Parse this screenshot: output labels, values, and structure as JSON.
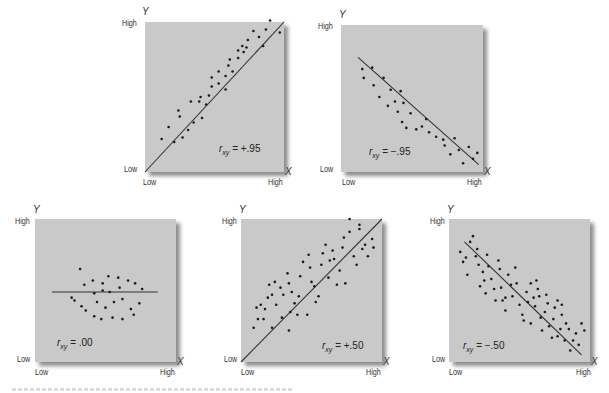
{
  "figure": {
    "axis_labels": {
      "x_axis": "X",
      "y_axis": "Y",
      "low": "Low",
      "high": "High"
    },
    "colors": {
      "plot_bg": "#c9c9c9",
      "dot": "#1a1a1a",
      "line": "#333333",
      "page_bg": "#ffffff"
    }
  },
  "chart_data": [
    {
      "type": "scatter",
      "title": "r_xy = +.95",
      "r_label": "= +.95",
      "xlabel": "X",
      "ylabel": "Y",
      "x_ticks": [
        "Low",
        "High"
      ],
      "y_ticks": [
        "Low",
        "High"
      ],
      "xlim": [
        0,
        1
      ],
      "ylim": [
        0,
        1
      ],
      "fit_line": [
        [
          0,
          0
        ],
        [
          1,
          1
        ]
      ],
      "points": [
        [
          0.12,
          0.22
        ],
        [
          0.17,
          0.3
        ],
        [
          0.21,
          0.2
        ],
        [
          0.24,
          0.41
        ],
        [
          0.25,
          0.37
        ],
        [
          0.27,
          0.23
        ],
        [
          0.31,
          0.28
        ],
        [
          0.33,
          0.47
        ],
        [
          0.35,
          0.33
        ],
        [
          0.39,
          0.47
        ],
        [
          0.4,
          0.5
        ],
        [
          0.41,
          0.36
        ],
        [
          0.44,
          0.45
        ],
        [
          0.46,
          0.51
        ],
        [
          0.48,
          0.57
        ],
        [
          0.48,
          0.63
        ],
        [
          0.53,
          0.67
        ],
        [
          0.53,
          0.59
        ],
        [
          0.58,
          0.64
        ],
        [
          0.58,
          0.55
        ],
        [
          0.6,
          0.71
        ],
        [
          0.61,
          0.75
        ],
        [
          0.63,
          0.67
        ],
        [
          0.67,
          0.76
        ],
        [
          0.67,
          0.81
        ],
        [
          0.7,
          0.84
        ],
        [
          0.71,
          0.8
        ],
        [
          0.73,
          0.83
        ],
        [
          0.74,
          0.88
        ],
        [
          0.78,
          0.94
        ],
        [
          0.82,
          0.9
        ],
        [
          0.85,
          0.84
        ],
        [
          0.87,
          0.95
        ],
        [
          0.9,
          1.01
        ],
        [
          0.97,
          0.93
        ]
      ]
    },
    {
      "type": "scatter",
      "title": "r_xy = -.95",
      "r_label": "= −.95",
      "xlabel": "X",
      "ylabel": "Y",
      "x_ticks": [
        "Low",
        "High"
      ],
      "y_ticks": [
        "Low",
        "High"
      ],
      "xlim": [
        0,
        1
      ],
      "ylim": [
        0,
        1
      ],
      "fit_line": [
        [
          0.12,
          0.78
        ],
        [
          0.97,
          0.05
        ]
      ],
      "points": [
        [
          0.15,
          0.7
        ],
        [
          0.16,
          0.64
        ],
        [
          0.22,
          0.71
        ],
        [
          0.23,
          0.59
        ],
        [
          0.27,
          0.51
        ],
        [
          0.3,
          0.64
        ],
        [
          0.33,
          0.45
        ],
        [
          0.35,
          0.56
        ],
        [
          0.38,
          0.48
        ],
        [
          0.4,
          0.41
        ],
        [
          0.42,
          0.55
        ],
        [
          0.43,
          0.34
        ],
        [
          0.44,
          0.47
        ],
        [
          0.46,
          0.3
        ],
        [
          0.49,
          0.4
        ],
        [
          0.53,
          0.29
        ],
        [
          0.57,
          0.31
        ],
        [
          0.6,
          0.36
        ],
        [
          0.62,
          0.27
        ],
        [
          0.67,
          0.24
        ],
        [
          0.72,
          0.22
        ],
        [
          0.73,
          0.18
        ],
        [
          0.77,
          0.12
        ],
        [
          0.8,
          0.23
        ],
        [
          0.83,
          0.15
        ],
        [
          0.86,
          0.06
        ],
        [
          0.9,
          0.17
        ],
        [
          0.93,
          0.09
        ],
        [
          0.96,
          0.13
        ]
      ]
    },
    {
      "type": "scatter",
      "title": "r_xy = .00",
      "r_label": "= .00",
      "xlabel": "X",
      "ylabel": "Y",
      "x_ticks": [
        "Low",
        "High"
      ],
      "y_ticks": [
        "Low",
        "High"
      ],
      "xlim": [
        0,
        1
      ],
      "ylim": [
        0,
        1
      ],
      "fit_line": [
        [
          0.12,
          0.49
        ],
        [
          0.87,
          0.49
        ]
      ],
      "points": [
        [
          0.32,
          0.65
        ],
        [
          0.41,
          0.57
        ],
        [
          0.48,
          0.55
        ],
        [
          0.52,
          0.6
        ],
        [
          0.59,
          0.59
        ],
        [
          0.66,
          0.57
        ],
        [
          0.48,
          0.5
        ],
        [
          0.35,
          0.54
        ],
        [
          0.42,
          0.48
        ],
        [
          0.53,
          0.49
        ],
        [
          0.6,
          0.52
        ],
        [
          0.71,
          0.55
        ],
        [
          0.76,
          0.51
        ],
        [
          0.74,
          0.41
        ],
        [
          0.28,
          0.43
        ],
        [
          0.33,
          0.39
        ],
        [
          0.36,
          0.36
        ],
        [
          0.42,
          0.32
        ],
        [
          0.47,
          0.3
        ],
        [
          0.55,
          0.31
        ],
        [
          0.62,
          0.3
        ],
        [
          0.68,
          0.37
        ],
        [
          0.7,
          0.33
        ],
        [
          0.5,
          0.38
        ],
        [
          0.56,
          0.42
        ],
        [
          0.26,
          0.45
        ],
        [
          0.44,
          0.42
        ],
        [
          0.62,
          0.44
        ]
      ]
    },
    {
      "type": "scatter",
      "title": "r_xy = +.50",
      "r_label": "= +.50",
      "xlabel": "X",
      "ylabel": "Y",
      "x_ticks": [
        "Low",
        "High"
      ],
      "y_ticks": [
        "Low",
        "High"
      ],
      "xlim": [
        0,
        1
      ],
      "ylim": [
        0,
        1
      ],
      "fit_line": [
        [
          0,
          0
        ],
        [
          1,
          1
        ]
      ],
      "points": [
        [
          0.09,
          0.24
        ],
        [
          0.12,
          0.3
        ],
        [
          0.11,
          0.38
        ],
        [
          0.14,
          0.4
        ],
        [
          0.16,
          0.3
        ],
        [
          0.17,
          0.37
        ],
        [
          0.19,
          0.45
        ],
        [
          0.22,
          0.47
        ],
        [
          0.25,
          0.4
        ],
        [
          0.2,
          0.54
        ],
        [
          0.24,
          0.56
        ],
        [
          0.28,
          0.52
        ],
        [
          0.3,
          0.47
        ],
        [
          0.33,
          0.62
        ],
        [
          0.34,
          0.55
        ],
        [
          0.36,
          0.49
        ],
        [
          0.38,
          0.41
        ],
        [
          0.35,
          0.35
        ],
        [
          0.4,
          0.33
        ],
        [
          0.41,
          0.46
        ],
        [
          0.42,
          0.6
        ],
        [
          0.44,
          0.7
        ],
        [
          0.48,
          0.75
        ],
        [
          0.49,
          0.66
        ],
        [
          0.5,
          0.56
        ],
        [
          0.52,
          0.53
        ],
        [
          0.53,
          0.42
        ],
        [
          0.55,
          0.46
        ],
        [
          0.57,
          0.68
        ],
        [
          0.58,
          0.76
        ],
        [
          0.6,
          0.82
        ],
        [
          0.62,
          0.59
        ],
        [
          0.63,
          0.71
        ],
        [
          0.65,
          0.78
        ],
        [
          0.66,
          0.72
        ],
        [
          0.68,
          0.54
        ],
        [
          0.7,
          0.64
        ],
        [
          0.72,
          0.8
        ],
        [
          0.73,
          0.87
        ],
        [
          0.74,
          0.55
        ],
        [
          0.77,
          0.91
        ],
        [
          0.8,
          0.74
        ],
        [
          0.82,
          0.68
        ],
        [
          0.84,
          0.93
        ],
        [
          0.86,
          0.79
        ],
        [
          0.88,
          0.82
        ],
        [
          0.9,
          0.74
        ],
        [
          0.93,
          0.86
        ],
        [
          0.94,
          0.8
        ],
        [
          0.77,
          1.0
        ],
        [
          0.84,
          0.96
        ],
        [
          0.22,
          0.24
        ],
        [
          0.34,
          0.22
        ],
        [
          0.47,
          0.33
        ],
        [
          0.29,
          0.31
        ]
      ]
    },
    {
      "type": "scatter",
      "title": "r_xy = -.50",
      "r_label": "= −.50",
      "xlabel": "X",
      "ylabel": "Y",
      "x_ticks": [
        "Low",
        "High"
      ],
      "y_ticks": [
        "Low",
        "High"
      ],
      "xlim": [
        0,
        1
      ],
      "ylim": [
        0,
        1
      ],
      "fit_line": [
        [
          0.11,
          0.84
        ],
        [
          0.94,
          0.05
        ]
      ],
      "points": [
        [
          0.08,
          0.77
        ],
        [
          0.1,
          0.7
        ],
        [
          0.12,
          0.73
        ],
        [
          0.13,
          0.61
        ],
        [
          0.15,
          0.84
        ],
        [
          0.17,
          0.88
        ],
        [
          0.19,
          0.74
        ],
        [
          0.2,
          0.79
        ],
        [
          0.21,
          0.68
        ],
        [
          0.22,
          0.53
        ],
        [
          0.24,
          0.63
        ],
        [
          0.25,
          0.57
        ],
        [
          0.27,
          0.75
        ],
        [
          0.28,
          0.67
        ],
        [
          0.3,
          0.58
        ],
        [
          0.32,
          0.51
        ],
        [
          0.33,
          0.43
        ],
        [
          0.35,
          0.71
        ],
        [
          0.36,
          0.65
        ],
        [
          0.37,
          0.52
        ],
        [
          0.38,
          0.43
        ],
        [
          0.4,
          0.36
        ],
        [
          0.42,
          0.61
        ],
        [
          0.44,
          0.54
        ],
        [
          0.45,
          0.46
        ],
        [
          0.47,
          0.66
        ],
        [
          0.48,
          0.55
        ],
        [
          0.5,
          0.4
        ],
        [
          0.52,
          0.33
        ],
        [
          0.53,
          0.29
        ],
        [
          0.55,
          0.49
        ],
        [
          0.56,
          0.42
        ],
        [
          0.58,
          0.27
        ],
        [
          0.6,
          0.45
        ],
        [
          0.61,
          0.39
        ],
        [
          0.63,
          0.51
        ],
        [
          0.64,
          0.46
        ],
        [
          0.65,
          0.31
        ],
        [
          0.66,
          0.22
        ],
        [
          0.68,
          0.35
        ],
        [
          0.7,
          0.41
        ],
        [
          0.71,
          0.25
        ],
        [
          0.73,
          0.17
        ],
        [
          0.74,
          0.3
        ],
        [
          0.75,
          0.38
        ],
        [
          0.77,
          0.18
        ],
        [
          0.79,
          0.23
        ],
        [
          0.8,
          0.33
        ],
        [
          0.82,
          0.15
        ],
        [
          0.83,
          0.27
        ],
        [
          0.85,
          0.23
        ],
        [
          0.86,
          0.08
        ],
        [
          0.88,
          0.15
        ],
        [
          0.9,
          0.2
        ],
        [
          0.92,
          0.12
        ],
        [
          0.94,
          0.27
        ],
        [
          0.96,
          0.22
        ],
        [
          0.58,
          0.55
        ],
        [
          0.62,
          0.57
        ],
        [
          0.69,
          0.47
        ],
        [
          0.77,
          0.43
        ],
        [
          0.8,
          0.4
        ],
        [
          0.4,
          0.45
        ],
        [
          0.26,
          0.48
        ]
      ]
    }
  ]
}
